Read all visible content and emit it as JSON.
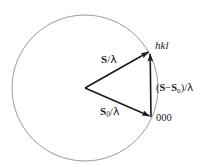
{
  "figure": {
    "background_color": "#ffffff",
    "circle": {
      "name": "ewald-sphere",
      "center_x": 85,
      "center_y": 88,
      "radius": 73,
      "stroke_color": "#8c8c8c",
      "stroke_width": 0.9,
      "fill": "none"
    },
    "vectors": [
      {
        "name": "incident-wavevector",
        "label": "S/λ",
        "from": [
          85,
          88
        ],
        "to": [
          150,
          51
        ],
        "stroke_color": "#1a1a1a",
        "stroke_width": 1.6
      },
      {
        "name": "scattered-wavevector",
        "label": "S0/λ",
        "from": [
          85,
          88
        ],
        "to": [
          151,
          117
        ],
        "stroke_color": "#1a1a1a",
        "stroke_width": 1.6
      },
      {
        "name": "scattering-vector",
        "label": "(S−S0)/λ",
        "from": [
          151,
          117
        ],
        "to": [
          150,
          51
        ],
        "stroke_color": "#1a1a1a",
        "stroke_width": 1.6
      }
    ],
    "labels": {
      "s_over_lambda": {
        "vec": "S",
        "sub": "",
        "div": "/",
        "lambda": "λ"
      },
      "s0_over_lambda": {
        "vec": "S",
        "sub": "0",
        "div": "/",
        "lambda": "λ"
      },
      "s_minus_s0_over_lambda": {
        "open": "(",
        "vec1": "S",
        "minus": "−",
        "vec2": "S",
        "sub2": "0",
        "close": ")",
        "div": "/",
        "lambda": "λ"
      },
      "reflection_point": "hkl",
      "origin_point": "000"
    }
  }
}
